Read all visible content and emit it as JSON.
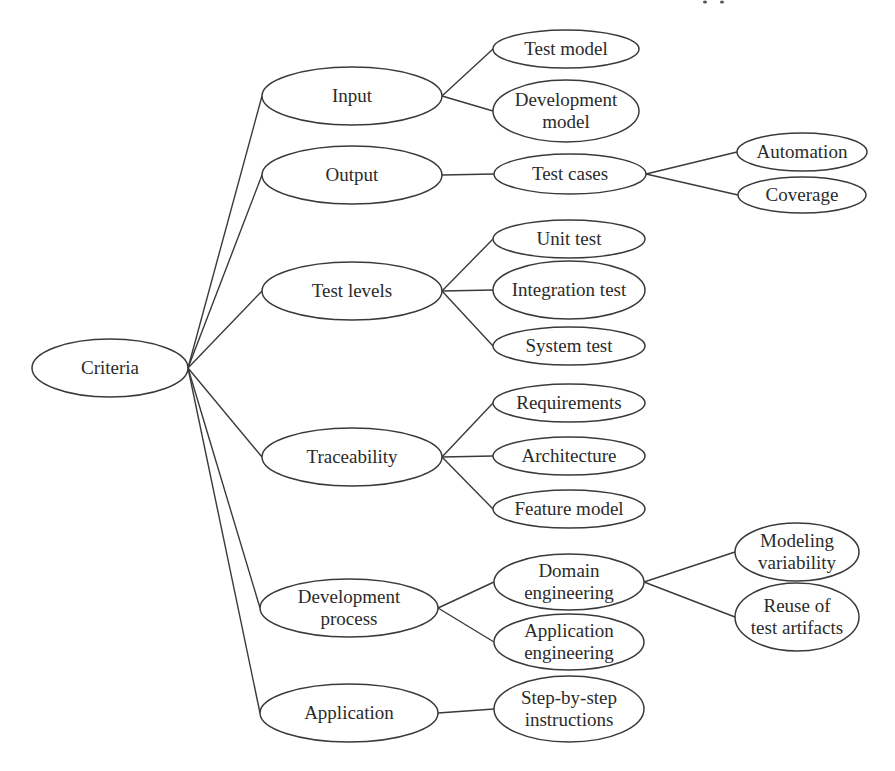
{
  "diagram": {
    "type": "mind-map",
    "root": {
      "id": "criteria",
      "label": [
        "Criteria"
      ],
      "cx": 110,
      "cy": 368,
      "rx": 78,
      "ry": 29
    },
    "nodes": [
      {
        "id": "input",
        "label": [
          "Input"
        ],
        "cx": 352,
        "cy": 96,
        "rx": 90,
        "ry": 29,
        "parent": "criteria"
      },
      {
        "id": "test-model",
        "label": [
          "Test model"
        ],
        "cx": 566,
        "cy": 49,
        "rx": 73,
        "ry": 19,
        "parent": "input"
      },
      {
        "id": "development-model",
        "label": [
          "Development",
          "model"
        ],
        "cx": 566,
        "cy": 111,
        "rx": 73,
        "ry": 31,
        "parent": "input"
      },
      {
        "id": "output",
        "label": [
          "Output"
        ],
        "cx": 352,
        "cy": 175,
        "rx": 90,
        "ry": 29,
        "parent": "criteria"
      },
      {
        "id": "test-cases",
        "label": [
          "Test cases"
        ],
        "cx": 570,
        "cy": 174,
        "rx": 76,
        "ry": 20,
        "parent": "output"
      },
      {
        "id": "automation",
        "label": [
          "Automation"
        ],
        "cx": 802,
        "cy": 152,
        "rx": 65,
        "ry": 19,
        "parent": "test-cases"
      },
      {
        "id": "coverage",
        "label": [
          "Coverage"
        ],
        "cx": 802,
        "cy": 195,
        "rx": 64,
        "ry": 18,
        "parent": "test-cases"
      },
      {
        "id": "test-levels",
        "label": [
          "Test levels"
        ],
        "cx": 352,
        "cy": 291,
        "rx": 90,
        "ry": 29,
        "parent": "criteria"
      },
      {
        "id": "unit-test",
        "label": [
          "Unit test"
        ],
        "cx": 569,
        "cy": 239,
        "rx": 76,
        "ry": 19,
        "parent": "test-levels"
      },
      {
        "id": "integration-test",
        "label": [
          "Integration test"
        ],
        "cx": 569,
        "cy": 290,
        "rx": 76,
        "ry": 29,
        "parent": "test-levels"
      },
      {
        "id": "system-test",
        "label": [
          "System test"
        ],
        "cx": 569,
        "cy": 346,
        "rx": 76,
        "ry": 19,
        "parent": "test-levels"
      },
      {
        "id": "traceability",
        "label": [
          "Traceability"
        ],
        "cx": 352,
        "cy": 457,
        "rx": 90,
        "ry": 29,
        "parent": "criteria"
      },
      {
        "id": "requirements",
        "label": [
          "Requirements"
        ],
        "cx": 569,
        "cy": 403,
        "rx": 76,
        "ry": 19,
        "parent": "traceability"
      },
      {
        "id": "architecture",
        "label": [
          "Architecture"
        ],
        "cx": 569,
        "cy": 456,
        "rx": 76,
        "ry": 19,
        "parent": "traceability"
      },
      {
        "id": "feature-model",
        "label": [
          "Feature model"
        ],
        "cx": 569,
        "cy": 509,
        "rx": 76,
        "ry": 19,
        "parent": "traceability"
      },
      {
        "id": "development-process",
        "label": [
          "Development",
          "process"
        ],
        "cx": 349,
        "cy": 608,
        "rx": 89,
        "ry": 29,
        "parent": "criteria"
      },
      {
        "id": "domain-engineering",
        "label": [
          "Domain",
          "engineering"
        ],
        "cx": 569,
        "cy": 582,
        "rx": 75,
        "ry": 28,
        "parent": "development-process"
      },
      {
        "id": "application-engineering",
        "label": [
          "Application",
          "engineering"
        ],
        "cx": 569,
        "cy": 642,
        "rx": 75,
        "ry": 28,
        "parent": "development-process"
      },
      {
        "id": "modeling-variability",
        "label": [
          "Modeling",
          "variability"
        ],
        "cx": 797,
        "cy": 552,
        "rx": 62,
        "ry": 29,
        "parent": "domain-engineering"
      },
      {
        "id": "reuse-of-test-artifacts",
        "label": [
          "Reuse of",
          "test artifacts"
        ],
        "cx": 797,
        "cy": 617,
        "rx": 62,
        "ry": 34,
        "parent": "domain-engineering"
      },
      {
        "id": "application",
        "label": [
          "Application"
        ],
        "cx": 349,
        "cy": 713,
        "rx": 89,
        "ry": 29,
        "parent": "criteria"
      },
      {
        "id": "step-by-step-instructions",
        "label": [
          "Step-by-step",
          "instructions"
        ],
        "cx": 569,
        "cy": 709,
        "rx": 75,
        "ry": 33,
        "parent": "application"
      }
    ],
    "colors": {
      "stroke": "#3a3a3a",
      "text": "#2b2b2b",
      "background": "#ffffff"
    }
  }
}
